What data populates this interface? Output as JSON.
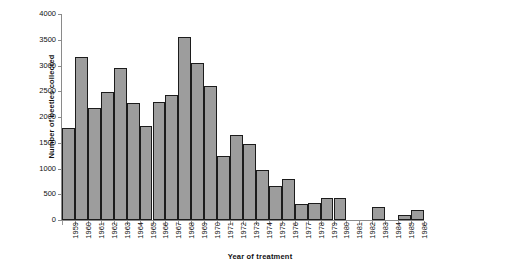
{
  "chart_data": {
    "type": "bar",
    "title": "",
    "xlabel": "Year of treatment",
    "ylabel": "Number of beetles collected",
    "ylim": [
      0,
      4000
    ],
    "ytick_labels": [
      "0",
      "500",
      "1000",
      "1500",
      "2000",
      "2500",
      "3000",
      "3500",
      "4000"
    ],
    "ytick_values": [
      0,
      500,
      1000,
      1500,
      2000,
      2500,
      3000,
      3500,
      4000
    ],
    "grid": false,
    "legend": null,
    "bar_color": "#9d9d9d",
    "bar_edge_color": "#1c1c1c",
    "axis_color": "#8a8a8a",
    "categories": [
      "1959",
      "1960",
      "1961",
      "1962",
      "1963",
      "1964",
      "1965",
      "1966",
      "1967",
      "1968",
      "1969",
      "1970",
      "1971",
      "1972",
      "1973",
      "1974",
      "1975",
      "1976",
      "1977",
      "1978",
      "1979",
      "1980",
      "1981",
      "1982",
      "1983",
      "1984",
      "1985",
      "1986"
    ],
    "values": [
      1790,
      3170,
      2180,
      2490,
      2960,
      2270,
      1820,
      2290,
      2430,
      3550,
      3050,
      2610,
      1250,
      1660,
      1470,
      980,
      670,
      800,
      320,
      330,
      430,
      430,
      0,
      0,
      250,
      0,
      100,
      200
    ]
  }
}
